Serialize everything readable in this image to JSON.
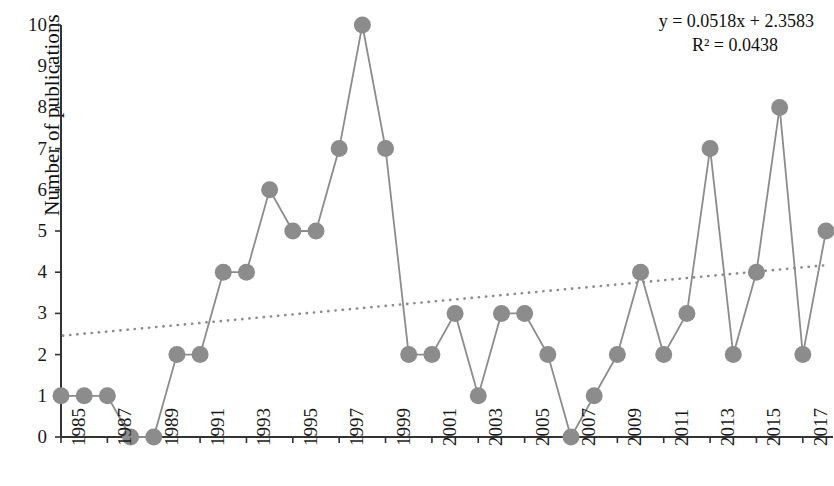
{
  "chart_data": {
    "type": "line",
    "title": "",
    "xlabel": "",
    "ylabel": "Number of publications",
    "ylim": [
      0,
      10
    ],
    "xlim": [
      1985,
      2018
    ],
    "grid": false,
    "legend": false,
    "x": [
      1985,
      1986,
      1987,
      1988,
      1989,
      1990,
      1991,
      1992,
      1993,
      1994,
      1995,
      1996,
      1997,
      1998,
      1999,
      2000,
      2001,
      2002,
      2003,
      2004,
      2005,
      2006,
      2007,
      2008,
      2009,
      2010,
      2011,
      2012,
      2013,
      2014,
      2015,
      2016,
      2017,
      2018
    ],
    "values": [
      1,
      1,
      1,
      0,
      0,
      2,
      2,
      4,
      4,
      6,
      5,
      5,
      7,
      10,
      7,
      2,
      2,
      3,
      1,
      3,
      3,
      2,
      0,
      1,
      2,
      4,
      2,
      3,
      7,
      2,
      4,
      8,
      2,
      5
    ],
    "series": [
      {
        "name": "Number of publications",
        "values": [
          1,
          1,
          1,
          0,
          0,
          2,
          2,
          4,
          4,
          6,
          5,
          5,
          7,
          10,
          7,
          2,
          2,
          3,
          1,
          3,
          3,
          2,
          0,
          1,
          2,
          4,
          2,
          3,
          7,
          2,
          4,
          8,
          2,
          5
        ]
      }
    ],
    "ytick_labels": [
      "0",
      "1",
      "2",
      "3",
      "4",
      "5",
      "6",
      "7",
      "8",
      "9",
      "10"
    ],
    "xtick_labels": [
      "1985",
      "1987",
      "1989",
      "1991",
      "1993",
      "1995",
      "1997",
      "1999",
      "2001",
      "2003",
      "2005",
      "2007",
      "2009",
      "2011",
      "2013",
      "2015",
      "2017"
    ],
    "xtick_values": [
      1985,
      1987,
      1989,
      1991,
      1993,
      1995,
      1997,
      1999,
      2001,
      2003,
      2005,
      2007,
      2009,
      2011,
      2013,
      2015,
      2017
    ],
    "xtick_rotation": -90,
    "trendline": {
      "type": "linear",
      "equation": "y = 0.0518x + 2.3583",
      "r_squared_label": "R² = 0.0438",
      "r_squared": 0.0438,
      "slope": 0.0518,
      "intercept": 2.3583,
      "style": "dotted",
      "y_start": 2.46,
      "y_end": 4.17
    },
    "colors": {
      "marker": "#8c8c8c",
      "line": "#8c8c8c",
      "trendline": "#8c8c8c",
      "axis": "#333333",
      "text": "#1a1a1a",
      "background": "#ffffff"
    },
    "annotations": [
      {
        "text": "y = 0.0518x + 2.3583",
        "position": "top-right"
      },
      {
        "text": "R² = 0.0438",
        "position": "top-right"
      }
    ]
  }
}
